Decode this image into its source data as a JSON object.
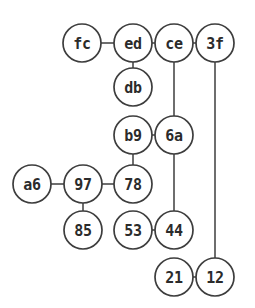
{
  "diagram": {
    "type": "node-link-graph",
    "background_color": "#ffffff",
    "node_fill_color": "#ffffff",
    "node_stroke_color": "#3d3d3d",
    "edge_color": "#4a4a4a",
    "label_color": "#2b2b2b",
    "node_radius": 19,
    "width": 255,
    "height": 308,
    "nodes": [
      {
        "id": "fc",
        "label": "fc",
        "cx": 82,
        "cy": 43
      },
      {
        "id": "ed",
        "label": "ed",
        "cx": 133,
        "cy": 43
      },
      {
        "id": "ce",
        "label": "ce",
        "cx": 174,
        "cy": 43
      },
      {
        "id": "3f",
        "label": "3f",
        "cx": 215,
        "cy": 43
      },
      {
        "id": "db",
        "label": "db",
        "cx": 133,
        "cy": 87
      },
      {
        "id": "b9",
        "label": "b9",
        "cx": 133,
        "cy": 135
      },
      {
        "id": "6a",
        "label": "6a",
        "cx": 174,
        "cy": 135
      },
      {
        "id": "a6",
        "label": "a6",
        "cx": 32,
        "cy": 184
      },
      {
        "id": "97",
        "label": "97",
        "cx": 83,
        "cy": 184
      },
      {
        "id": "78",
        "label": "78",
        "cx": 133,
        "cy": 184
      },
      {
        "id": "85",
        "label": "85",
        "cx": 83,
        "cy": 230
      },
      {
        "id": "53",
        "label": "53",
        "cx": 133,
        "cy": 230
      },
      {
        "id": "44",
        "label": "44",
        "cx": 174,
        "cy": 230
      },
      {
        "id": "21",
        "label": "21",
        "cx": 174,
        "cy": 277
      },
      {
        "id": "12",
        "label": "12",
        "cx": 215,
        "cy": 277
      }
    ],
    "edges": [
      {
        "source": "fc",
        "target": "ed"
      },
      {
        "source": "ed",
        "target": "ce"
      },
      {
        "source": "ce",
        "target": "3f"
      },
      {
        "source": "ed",
        "target": "db"
      },
      {
        "source": "ce",
        "target": "6a"
      },
      {
        "source": "b9",
        "target": "6a"
      },
      {
        "source": "b9",
        "target": "78"
      },
      {
        "source": "a6",
        "target": "97"
      },
      {
        "source": "97",
        "target": "78"
      },
      {
        "source": "97",
        "target": "85"
      },
      {
        "source": "6a",
        "target": "44"
      },
      {
        "source": "53",
        "target": "44"
      },
      {
        "source": "3f",
        "target": "12"
      },
      {
        "source": "21",
        "target": "12"
      }
    ]
  }
}
